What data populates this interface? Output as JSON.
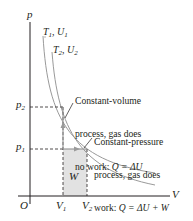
{
  "diagram": {
    "type": "pV-diagram",
    "axes": {
      "y_label": "p",
      "x_label": "V",
      "origin_label": "O",
      "y_ticks": [
        {
          "label": "p",
          "sub": "2"
        },
        {
          "label": "p",
          "sub": "1"
        }
      ],
      "x_ticks": [
        {
          "label": "V",
          "sub": "1"
        },
        {
          "label": "V",
          "sub": "2"
        }
      ]
    },
    "isotherms": [
      {
        "label": "T",
        "sub1": "1",
        "sep": ", ",
        "label2": "U",
        "sub2": "1"
      },
      {
        "label": "T",
        "sub1": "2",
        "sep": ", ",
        "label2": "U",
        "sub2": "2"
      }
    ],
    "area_label": "W",
    "annotations": [
      {
        "line1": "Constant-volume",
        "line2": "process, gas does",
        "line3_text": "no work: ",
        "line3_math": "Q = ΔU"
      },
      {
        "line1": "Constant-pressure",
        "line2": "process, gas does",
        "line3_text": "work: ",
        "line3_math": "Q = ΔU + W"
      }
    ],
    "colors": {
      "axis": "#231f20",
      "curve": "#9a9a9a",
      "work_area": "#e2e2e2",
      "arrow": "#9a9a9a",
      "dashed": "#231f20"
    }
  }
}
